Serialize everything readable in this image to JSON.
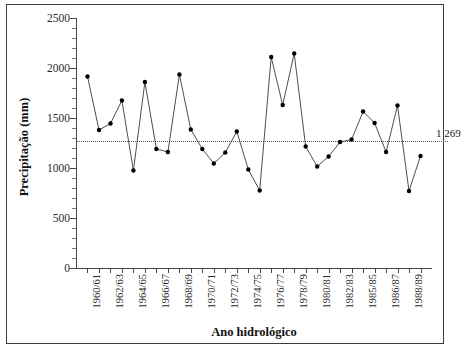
{
  "chart_data": {
    "type": "line",
    "title": "",
    "xlabel": "Ano hidrológico",
    "ylabel": "Precipitação (mm)",
    "ylim": [
      0,
      2500
    ],
    "yticks": [
      0,
      500,
      1000,
      1500,
      2000,
      2500
    ],
    "ytick_labels": [
      "0",
      "500",
      "1000",
      "1500",
      "2000",
      "2500"
    ],
    "grid": false,
    "legend": "none",
    "categories": [
      "1960/61",
      "1961/62",
      "1962/63",
      "1963/64",
      "1964/65",
      "1965/66",
      "1966/67",
      "1967/68",
      "1968/69",
      "1969/70",
      "1970/71",
      "1971/72",
      "1972/73",
      "1973/74",
      "1974/75",
      "1975/76",
      "1976/77",
      "1977/78",
      "1978/79",
      "1979/80",
      "1980/81",
      "1981/82",
      "1982/83",
      "1983/84",
      "1985/85",
      "1985/86",
      "1986/87",
      "1987/88",
      "1988/89",
      "1989/90"
    ],
    "xtick_labels": [
      "1960/61",
      "1962/63",
      "1964/65",
      "1966/67",
      "1968/69",
      "1970/71",
      "1972/73",
      "1974/75",
      "1976/77",
      "1978/79",
      "1980/81",
      "1982/83",
      "1985/85",
      "1986/87",
      "1988/89"
    ],
    "values": [
      1915,
      1380,
      1445,
      1675,
      975,
      1860,
      1190,
      1160,
      1935,
      1385,
      1190,
      1045,
      1155,
      1365,
      985,
      775,
      2110,
      1630,
      2145,
      1215,
      1015,
      1115,
      1260,
      1285,
      1565,
      1450,
      1160,
      1625,
      770,
      1120
    ],
    "series_name": "Precipitação anual",
    "marker": "filled-circle",
    "mean_line": {
      "value": 1269,
      "label": "1 269",
      "style": "dotted"
    }
  }
}
